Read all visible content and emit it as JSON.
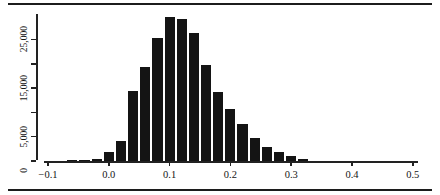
{
  "figure": {
    "name": "histogram-figure",
    "top_rule": "",
    "bottom_rule": ""
  },
  "chart_data": {
    "type": "bar",
    "title": "",
    "subtitle": "",
    "xlabel": "",
    "ylabel": "",
    "grid": false,
    "legend": null,
    "bar_color": "#141414",
    "axis_color": "#222222",
    "bin_width": 0.02,
    "xlim": [
      -0.12,
      0.52
    ],
    "ylim": [
      0,
      30000
    ],
    "x_ticks": [
      -0.1,
      0.0,
      0.1,
      0.2,
      0.3,
      0.4,
      0.5
    ],
    "x_tick_labels": [
      "−0.1",
      "0.0",
      "0.1",
      "0.2",
      "0.3",
      "0.4",
      "0.5"
    ],
    "y_ticks": [
      0,
      5000,
      10000,
      15000,
      20000,
      25000
    ],
    "y_tick_labels": [
      "0",
      "5,000",
      "",
      "15,000",
      "",
      "25,000"
    ],
    "bins": [
      {
        "x0": -0.07,
        "x1": -0.05,
        "center": -0.06,
        "value": 60
      },
      {
        "x0": -0.05,
        "x1": -0.03,
        "center": -0.04,
        "value": 300
      },
      {
        "x0": -0.03,
        "x1": -0.01,
        "center": -0.02,
        "value": 450
      },
      {
        "x0": -0.01,
        "x1": 0.01,
        "center": 0.0,
        "value": 1900
      },
      {
        "x0": 0.01,
        "x1": 0.03,
        "center": 0.02,
        "value": 4100
      },
      {
        "x0": 0.03,
        "x1": 0.05,
        "center": 0.04,
        "value": 14500
      },
      {
        "x0": 0.05,
        "x1": 0.07,
        "center": 0.06,
        "value": 19300
      },
      {
        "x0": 0.07,
        "x1": 0.09,
        "center": 0.08,
        "value": 25400
      },
      {
        "x0": 0.09,
        "x1": 0.11,
        "center": 0.1,
        "value": 29600
      },
      {
        "x0": 0.11,
        "x1": 0.13,
        "center": 0.12,
        "value": 29200
      },
      {
        "x0": 0.13,
        "x1": 0.15,
        "center": 0.14,
        "value": 26300
      },
      {
        "x0": 0.15,
        "x1": 0.17,
        "center": 0.16,
        "value": 19800
      },
      {
        "x0": 0.17,
        "x1": 0.19,
        "center": 0.18,
        "value": 14100
      },
      {
        "x0": 0.19,
        "x1": 0.21,
        "center": 0.2,
        "value": 10600
      },
      {
        "x0": 0.21,
        "x1": 0.23,
        "center": 0.22,
        "value": 7700
      },
      {
        "x0": 0.23,
        "x1": 0.25,
        "center": 0.24,
        "value": 4700
      },
      {
        "x0": 0.25,
        "x1": 0.27,
        "center": 0.26,
        "value": 2800
      },
      {
        "x0": 0.27,
        "x1": 0.29,
        "center": 0.28,
        "value": 1900
      },
      {
        "x0": 0.29,
        "x1": 0.31,
        "center": 0.3,
        "value": 1100
      },
      {
        "x0": 0.31,
        "x1": 0.33,
        "center": 0.32,
        "value": 400
      }
    ]
  }
}
